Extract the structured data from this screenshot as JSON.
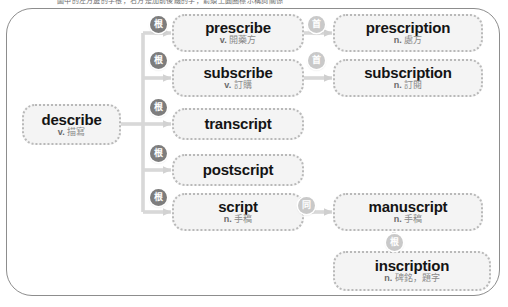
{
  "header": {
    "clipped_text": "圖中的左方邊的字根，右方是加前後綴的字，箭頭上圓圈標示構詞關係"
  },
  "diagram": {
    "type": "word-family-tree",
    "root": {
      "id": "describe",
      "word": "describe",
      "pos": "v.",
      "gloss": "描寫"
    },
    "branches": [
      {
        "badge": "根",
        "node": {
          "id": "prescribe",
          "word": "prescribe",
          "pos": "v.",
          "gloss": "開藥方"
        },
        "child": {
          "badge": "首",
          "node": {
            "id": "prescription",
            "word": "prescription",
            "pos": "n.",
            "gloss": "處方"
          }
        }
      },
      {
        "badge": "根",
        "node": {
          "id": "subscribe",
          "word": "subscribe",
          "pos": "v.",
          "gloss": "訂購"
        },
        "child": {
          "badge": "首",
          "node": {
            "id": "subscription",
            "word": "subscription",
            "pos": "n.",
            "gloss": "訂閱"
          }
        }
      },
      {
        "badge": "根",
        "node": {
          "id": "transcript",
          "word": "transcript",
          "pos": "",
          "gloss": ""
        },
        "child": null
      },
      {
        "badge": "根",
        "node": {
          "id": "postscript",
          "word": "postscript",
          "pos": "",
          "gloss": ""
        },
        "child": null
      },
      {
        "badge": "根",
        "node": {
          "id": "script",
          "word": "script",
          "pos": "n.",
          "gloss": "手稿"
        },
        "child": {
          "badge": "同",
          "node": {
            "id": "manuscript",
            "word": "manuscript",
            "pos": "n.",
            "gloss": "手稿"
          }
        }
      }
    ],
    "extra": {
      "badge": "根",
      "from": "manuscript",
      "node": {
        "id": "inscription",
        "word": "inscription",
        "pos": "n.",
        "gloss": "碑銘，題字"
      }
    }
  },
  "colors": {
    "frame_border": "#8d8d8d",
    "node_fill": "#f4f4f4",
    "node_border": "#b9b9b9",
    "word_text": "#141414",
    "gloss_text": "#8a8a8a",
    "badge_fill": "#9a9a9a",
    "wire": "#d0d0d0"
  }
}
